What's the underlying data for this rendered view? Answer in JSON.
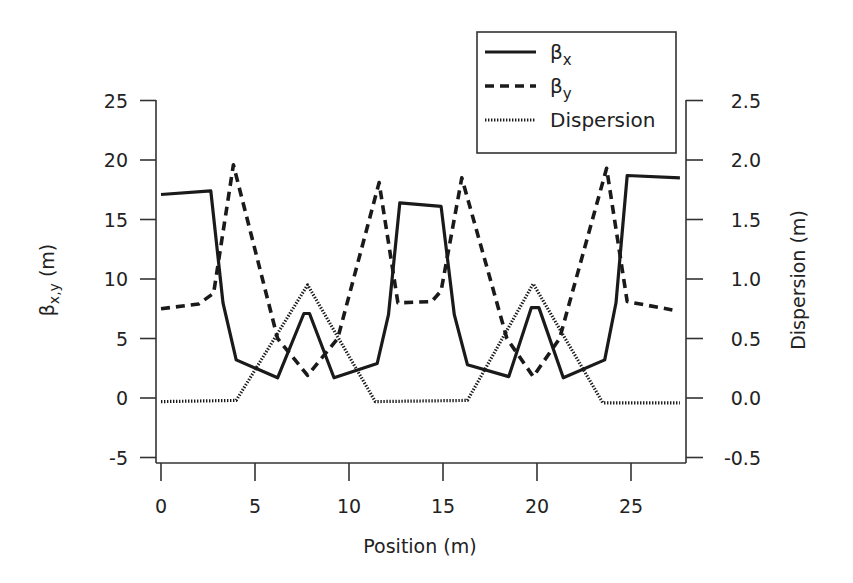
{
  "chart_data": {
    "type": "line",
    "title": "",
    "xlabel": "Position (m)",
    "ylabel": "βx,y (m)",
    "ylabel_right": "Dispersion (m)",
    "xlim": [
      0,
      27.6
    ],
    "ylim": [
      -5,
      25
    ],
    "ylim_right": [
      -0.5,
      2.5
    ],
    "x_ticks": [
      0,
      5,
      10,
      15,
      20,
      25
    ],
    "y_ticks": [
      -5,
      0,
      5,
      10,
      15,
      20,
      25
    ],
    "y_ticks_right": [
      "-0.5",
      "0.0",
      "0.5",
      "1.0",
      "1.5",
      "2.0",
      "2.5"
    ],
    "grid": false,
    "legend_position": "top-right",
    "series": [
      {
        "name": "βx",
        "label_main": "β",
        "label_sub": "x",
        "style": "solid",
        "axis": "left",
        "x": [
          0,
          2.65,
          3.3,
          4.0,
          6.2,
          7.6,
          7.9,
          9.2,
          11.5,
          12.1,
          12.7,
          14.9,
          15.6,
          16.3,
          18.5,
          19.7,
          20.1,
          21.4,
          23.6,
          24.2,
          24.8,
          27.6
        ],
        "y": [
          17.1,
          17.4,
          8.0,
          3.2,
          1.7,
          7.1,
          7.1,
          1.7,
          2.9,
          7.0,
          16.4,
          16.1,
          7.0,
          2.8,
          1.8,
          7.6,
          7.6,
          1.7,
          3.2,
          8.0,
          18.7,
          18.5
        ]
      },
      {
        "name": "βy",
        "label_main": "β",
        "label_sub": "y",
        "style": "dashed",
        "axis": "left",
        "x": [
          0,
          2.0,
          2.8,
          3.85,
          6.2,
          7.8,
          9.4,
          11.6,
          12.6,
          14.4,
          14.9,
          16.0,
          18.4,
          19.8,
          21.2,
          23.7,
          24.8,
          27.2
        ],
        "y": [
          7.5,
          7.9,
          8.8,
          19.6,
          5.0,
          1.9,
          5.0,
          18.1,
          8.0,
          8.1,
          9.0,
          18.5,
          5.0,
          1.8,
          5.0,
          19.3,
          8.1,
          7.4
        ]
      },
      {
        "name": "Dispersion",
        "label_main": "Dispersion",
        "label_sub": "",
        "style": "dotted",
        "axis": "right",
        "x": [
          0,
          4.0,
          7.8,
          11.4,
          16.3,
          19.8,
          23.5,
          27.6
        ],
        "y": [
          -0.03,
          -0.02,
          0.95,
          -0.03,
          -0.02,
          0.96,
          -0.04,
          -0.04
        ]
      }
    ]
  }
}
